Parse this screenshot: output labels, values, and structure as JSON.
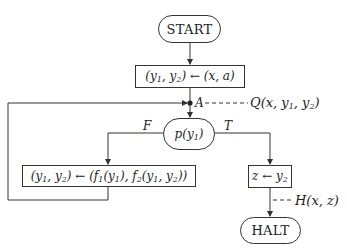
{
  "diagram": {
    "type": "flowchart",
    "nodes": {
      "start": {
        "label": "START",
        "shape": "terminal"
      },
      "init": {
        "label": "(y1, y2) ← (x, a)",
        "shape": "process",
        "parts": [
          "(y",
          "1",
          ", y",
          "2",
          ") ← (x, a)"
        ]
      },
      "junction": {
        "label": "A",
        "shape": "junction-point"
      },
      "decision": {
        "label": "p(y1)",
        "shape": "decision",
        "parts": [
          "p(y",
          "1",
          ")"
        ]
      },
      "loop_body": {
        "label": "(y1, y2) ← (f1(y1), f2(y1, y2))",
        "shape": "process",
        "parts": [
          "(y",
          "1",
          ", y",
          "2",
          ") ← (f",
          "1",
          "(y",
          "1",
          "), f",
          "2",
          "(y",
          "1",
          ", y",
          "2",
          "))"
        ]
      },
      "output": {
        "label": "z ← y2",
        "shape": "process",
        "parts": [
          "z ← y",
          "2"
        ]
      },
      "halt": {
        "label": "HALT",
        "shape": "terminal"
      }
    },
    "branch_labels": {
      "false": "F",
      "true": "T"
    },
    "assertions": {
      "invariant": {
        "label": "Q(x, y1, y2)",
        "attached_to": "A",
        "parts": [
          "Q(x, y",
          "1",
          ", y",
          "2",
          ")"
        ]
      },
      "output": {
        "label": "H(x, z)",
        "attached_to": "output-edge"
      }
    },
    "edges": [
      {
        "from": "start",
        "to": "init"
      },
      {
        "from": "init",
        "to": "junction"
      },
      {
        "from": "junction",
        "to": "decision"
      },
      {
        "from": "decision",
        "to": "loop_body",
        "label": "F"
      },
      {
        "from": "decision",
        "to": "output",
        "label": "T"
      },
      {
        "from": "loop_body",
        "to": "junction"
      },
      {
        "from": "output",
        "to": "halt"
      }
    ],
    "colors": {
      "stroke": "#333333",
      "background": "#ffffff",
      "text": "#222222"
    }
  }
}
